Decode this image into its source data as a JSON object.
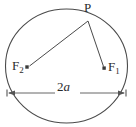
{
  "figure": {
    "type": "ellipse-foci-diagram",
    "labels": {
      "point_p": "P",
      "focus_1_base": "F",
      "focus_1_sub": "1",
      "focus_2_base": "F",
      "focus_2_sub": "2",
      "major_axis_number": "2",
      "major_axis_variable": "a"
    },
    "colors": {
      "stroke": "#4a4a4a",
      "text": "#2b2b2b",
      "background": "#ffffff",
      "dimension_line": "#555555"
    },
    "geometry": {
      "ellipse_center_x": 66.5,
      "ellipse_center_y": 66,
      "ellipse_radius_x": 61,
      "ellipse_radius_y": 57,
      "point_p_x": 88,
      "point_p_y": 21,
      "focus_1_x": 104,
      "focus_1_y": 68,
      "focus_2_x": 27,
      "focus_2_y": 67,
      "dimension_line_y": 93,
      "dimension_left_x": 7,
      "dimension_right_x": 126
    }
  }
}
